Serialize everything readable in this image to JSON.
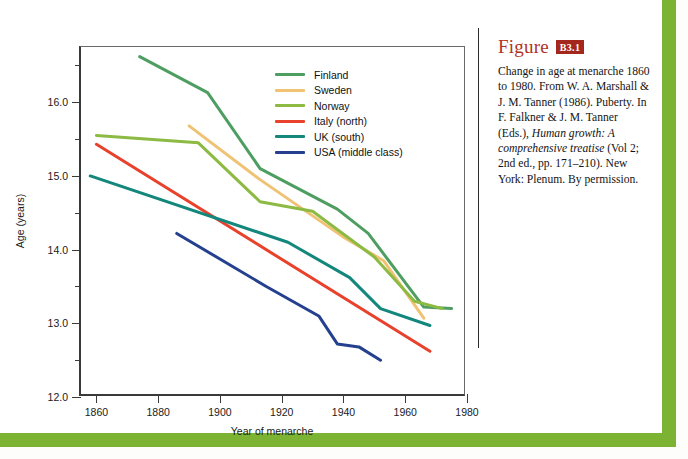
{
  "figure": {
    "word": "Figure",
    "number": "B3.1",
    "caption_part1": "Change in age at menarche 1860 to 1980. From W. A. Marshall & J. M. Tanner (1986). Puberty. In F. Falkner & J. M. Tanner (Eds.), ",
    "caption_italic": "Human growth: A comprehensive treatise",
    "caption_part2": " (Vol 2; 2nd ed., pp. 171–210). New York: Plenum. By permission."
  },
  "colors": {
    "frame_green": "#7cb332",
    "figure_red": "#b03225",
    "badge_red": "#a4271d",
    "finland": "#4e9e62",
    "sweden": "#f0c274",
    "norway": "#8cba42",
    "italy": "#e8412c",
    "uk": "#13877c",
    "usa": "#24408e"
  },
  "chart_data": {
    "type": "line",
    "title": "",
    "xlabel": "Year of menarche",
    "ylabel": "Age (years)",
    "xlim": [
      1855,
      1980
    ],
    "ylim": [
      12.0,
      16.75
    ],
    "xticks": [
      1860,
      1880,
      1900,
      1920,
      1940,
      1960,
      1980
    ],
    "yticks": [
      12.0,
      13.0,
      14.0,
      15.0,
      16.0
    ],
    "yticks_minor": [
      12.5,
      13.5,
      14.5,
      15.5,
      16.5
    ],
    "grid": false,
    "legend_position": "top-right",
    "series": [
      {
        "name": "Finland",
        "color": "#4e9e62",
        "x": [
          1874,
          1896,
          1913,
          1938,
          1948,
          1966,
          1975
        ],
        "y": [
          16.62,
          16.13,
          15.1,
          14.55,
          14.22,
          13.22,
          13.2
        ]
      },
      {
        "name": "Sweden",
        "color": "#f0c274",
        "x": [
          1890,
          1913,
          1940,
          1953,
          1966
        ],
        "y": [
          15.68,
          14.95,
          14.17,
          13.85,
          13.07
        ]
      },
      {
        "name": "Norway",
        "color": "#8cba42",
        "x": [
          1860,
          1893,
          1913,
          1930,
          1950,
          1963,
          1972
        ],
        "y": [
          15.55,
          15.45,
          14.65,
          14.52,
          13.9,
          13.3,
          13.2
        ]
      },
      {
        "name": "Italy (north)",
        "color": "#e8412c",
        "x": [
          1860,
          1968
        ],
        "y": [
          15.43,
          12.62
        ]
      },
      {
        "name": "UK (south)",
        "color": "#13877c",
        "x": [
          1858,
          1922,
          1942,
          1952,
          1968
        ],
        "y": [
          15.0,
          14.1,
          13.62,
          13.2,
          12.97
        ]
      },
      {
        "name": "USA (middle class)",
        "color": "#24408e",
        "x": [
          1886,
          1915,
          1932,
          1938,
          1945,
          1952
        ],
        "y": [
          14.22,
          13.5,
          13.1,
          12.72,
          12.68,
          12.5
        ]
      }
    ]
  }
}
